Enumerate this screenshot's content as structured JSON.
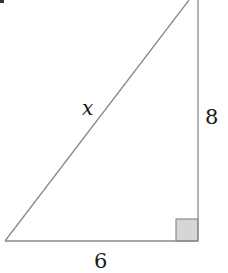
{
  "figure": {
    "type": "right-triangle",
    "labels": {
      "hypotenuse": "x",
      "vertical_leg": "8",
      "horizontal_leg": "6"
    },
    "colors": {
      "stroke": "#8a8a8a",
      "right_angle_fill": "#d6d6d6",
      "right_angle_stroke": "#8a8a8a",
      "text": "#1a1a1a",
      "corner_mark": "#333333"
    },
    "vertices": {
      "bottom_left": [
        5,
        241
      ],
      "bottom_right": [
        198,
        241
      ],
      "top": [
        189,
        0
      ]
    },
    "right_angle_marker": {
      "corner": "bottom_right",
      "size": 22
    }
  }
}
